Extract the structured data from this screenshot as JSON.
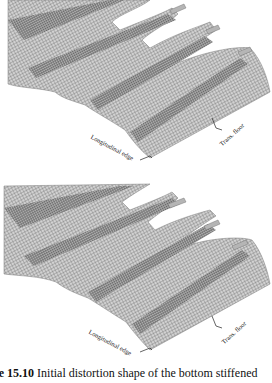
{
  "figure": {
    "panels": [
      {
        "id": "top",
        "labels": {
          "longitudinal_edge": "Longitudinal edge",
          "trans_floor": "Trans. floor"
        }
      },
      {
        "id": "bottom",
        "labels": {
          "longitudinal_edge": "Longitudinal edge",
          "trans_floor": "Trans. floor"
        }
      }
    ],
    "caption": {
      "number": "ure 15.10",
      "text": " Initial distortion shape of the bottom stiffened"
    },
    "colors": {
      "mesh_line": "#6e6e6e",
      "mesh_fill": "#c9c9c9",
      "mesh_dark": "#8a8a8a",
      "background": "#ffffff"
    }
  }
}
